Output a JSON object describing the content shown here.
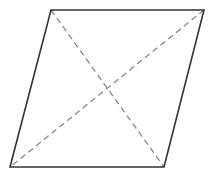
{
  "diagram": {
    "type": "parallelogram-with-diagonals",
    "shape": "rhombus",
    "vertices": {
      "top_left": [
        51,
        10
      ],
      "top_right": [
        204,
        10
      ],
      "bottom_right": [
        164,
        167
      ],
      "bottom_left": [
        10,
        167
      ]
    },
    "edges": {
      "stroke": "#333333",
      "stroke_width": 1.6,
      "style": "solid"
    },
    "diagonals": [
      {
        "from": "top_left",
        "to": "bottom_right"
      },
      {
        "from": "top_right",
        "to": "bottom_left"
      }
    ],
    "diagonal_style": {
      "stroke": "#888888",
      "stroke_width": 1.3,
      "dash": "6 4"
    },
    "intersection": [
      107,
      89
    ],
    "labels": []
  }
}
